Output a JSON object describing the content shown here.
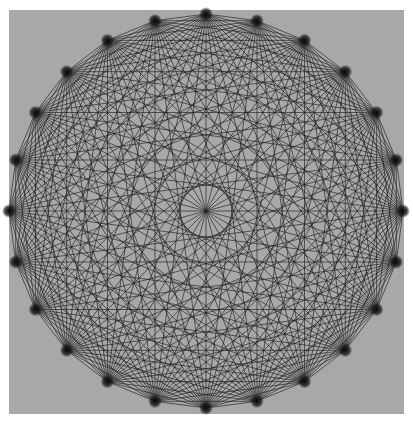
{
  "figure": {
    "background_color": "#ffffff",
    "panel_color": "#a8a8a8",
    "line_color": "#1a1a1a",
    "node_color": "#111111",
    "node_count": 24,
    "center": [
      206,
      211
    ],
    "radius": 197,
    "panel": {
      "x": 9,
      "y": 10,
      "width": 395,
      "height": 404
    }
  }
}
